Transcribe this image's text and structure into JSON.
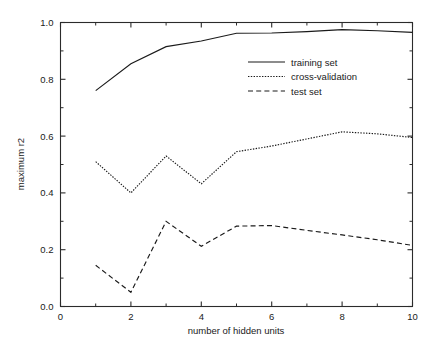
{
  "chart_data": {
    "type": "line",
    "title": "",
    "xlabel": "number of hidden units",
    "ylabel": "maximum r2",
    "xlim": [
      0,
      10
    ],
    "ylim": [
      0.0,
      1.0
    ],
    "grid": false,
    "legend_position": "upper right",
    "x_ticks_major": [
      0,
      2,
      4,
      6,
      8,
      10
    ],
    "x_tick_labels": [
      "0",
      "2",
      "4",
      "6",
      "8",
      "10"
    ],
    "x_ticks_minor": [
      1,
      3,
      5,
      7,
      9
    ],
    "y_ticks_major": [
      0.0,
      0.2,
      0.4,
      0.6,
      0.8,
      1.0
    ],
    "y_tick_labels": [
      "0.0",
      "0.2",
      "0.4",
      "0.6",
      "0.8",
      "1.0"
    ],
    "y_ticks_minor": [
      0.1,
      0.3,
      0.5,
      0.7,
      0.9
    ],
    "x": [
      1,
      2,
      3,
      4,
      5,
      6,
      7,
      8,
      9,
      10
    ],
    "series": [
      {
        "name": "training set",
        "style": "solid",
        "values": [
          0.76,
          0.855,
          0.915,
          0.935,
          0.962,
          0.963,
          0.968,
          0.975,
          0.971,
          0.965
        ]
      },
      {
        "name": "cross-validation",
        "style": "dotted",
        "values": [
          0.51,
          0.4,
          0.53,
          0.432,
          0.545,
          0.565,
          0.59,
          0.615,
          0.608,
          0.595
        ]
      },
      {
        "name": "test set",
        "style": "dashed",
        "values": [
          0.145,
          0.05,
          0.3,
          0.212,
          0.283,
          0.285,
          0.268,
          0.252,
          0.235,
          0.215
        ]
      }
    ]
  },
  "legend": {
    "items": [
      {
        "label": "training set",
        "style": "solid"
      },
      {
        "label": "cross-validation",
        "style": "dotted"
      },
      {
        "label": "test set",
        "style": "dashed"
      }
    ]
  },
  "axes": {
    "x_title": "number of hidden units",
    "y_title": "maximum r2"
  }
}
